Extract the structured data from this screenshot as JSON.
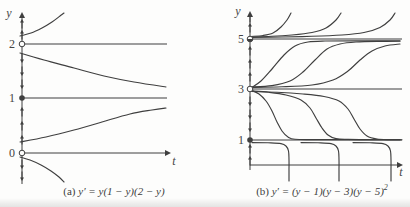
{
  "figure": {
    "kind": "phase portraits with solution curves for autonomous ODEs",
    "ink": "#3f3f3f",
    "background": "#fdfdfc"
  },
  "captions": {
    "a": {
      "prefix": "(a) ",
      "math": "y′ = y(1 − y)(2 − y)",
      "sup": ""
    },
    "b": {
      "prefix": "(b) ",
      "math": "y′ = (y − 1)(y − 3)(y − 5)",
      "sup": "2"
    }
  },
  "chart_data": [
    {
      "type": "line",
      "panel": "a",
      "title": "(a) y′ = y(1 − y)(2 − y)",
      "xlabel": "t",
      "ylabel": "y",
      "yticks": [
        0,
        1,
        2
      ],
      "grid": false,
      "legend": false,
      "equilibria": [
        {
          "y": 2,
          "marker": "open",
          "stability": "repeller"
        },
        {
          "y": 1,
          "marker": "filled",
          "stability": "attractor"
        },
        {
          "y": 0,
          "marker": "open",
          "stability": "repeller"
        }
      ],
      "flow_arrows": [
        {
          "region": "y > 2",
          "direction": "up",
          "count": 2
        },
        {
          "region": "1 < y < 2",
          "direction": "down",
          "count": 3
        },
        {
          "region": "0 < y < 1",
          "direction": "up",
          "count": 3
        },
        {
          "region": "y < 0",
          "direction": "down",
          "count": 2
        }
      ],
      "solution_curves": [
        {
          "region": "y > 2",
          "behavior": "increases steeply away from y = 2"
        },
        {
          "region": "1 < y < 2",
          "behavior": "decreases from near y = 2 toward y = 1"
        },
        {
          "region": "0 < y < 1",
          "behavior": "increases from near y = 0 toward y = 1"
        },
        {
          "region": "y < 0",
          "behavior": "decreases away from y = 0"
        }
      ]
    },
    {
      "type": "line",
      "panel": "b",
      "title": "(b) y′ = (y − 1)(y − 3)(y − 5)²",
      "xlabel": "t",
      "ylabel": "y",
      "yticks": [
        1,
        3,
        5
      ],
      "grid": false,
      "legend": false,
      "equilibria": [
        {
          "y": 5,
          "marker": "half-filled",
          "stability": "semi-stable"
        },
        {
          "y": 3,
          "marker": "open",
          "stability": "repeller"
        },
        {
          "y": 1,
          "marker": "filled",
          "stability": "attractor"
        }
      ],
      "flow_arrows": [
        {
          "region": "y > 5",
          "direction": "up",
          "count": 2
        },
        {
          "region": "3 < y < 5",
          "direction": "up",
          "count": 3
        },
        {
          "region": "1 < y < 3",
          "direction": "down",
          "count": 3
        },
        {
          "region": "y < 1",
          "direction": "up",
          "count": 2
        }
      ],
      "solution_curves": [
        {
          "region": "y > 5",
          "behavior": "three curves hug y = 5 then blow up steeply",
          "count": 3
        },
        {
          "region": "3 < y < 5",
          "behavior": "three sigmoid curves rise from y = 3 to y = 5",
          "count": 3
        },
        {
          "region": "1 < y < 3",
          "behavior": "three curves fall from y = 3 and level off at y = 1",
          "count": 3
        },
        {
          "region": "y < 1",
          "behavior": "three steep curves join y = 1 with vertical branches below it",
          "count": 3
        }
      ]
    }
  ],
  "render": {
    "ink": "#3f3f3f",
    "panels": [
      {
        "name": "a",
        "yAxis": {
          "x": 22,
          "y1": 12,
          "y2": 184
        },
        "tAxis": {
          "y": 153,
          "x1": 22,
          "x2": 171
        },
        "yLabel": {
          "text": "y",
          "x": 9,
          "y": 17
        },
        "tLabel": {
          "text": "t",
          "x": 174,
          "y": 165
        },
        "ticks": [
          {
            "text": "2",
            "x": 15,
            "y": 48
          },
          {
            "text": "1",
            "x": 15,
            "y": 102
          },
          {
            "text": "0",
            "x": 15,
            "y": 157
          }
        ],
        "eqLines": [
          {
            "y": 44,
            "x1": 22,
            "x2": 167
          },
          {
            "y": 98,
            "x1": 22,
            "x2": 167
          }
        ],
        "markers": [
          {
            "x": 22,
            "y": 44,
            "kind": "open"
          },
          {
            "x": 22,
            "y": 98,
            "kind": "filled"
          },
          {
            "x": 22,
            "y": 153,
            "kind": "open"
          }
        ],
        "flowArrows": [
          {
            "x": 22,
            "y": 24,
            "dir": "up"
          },
          {
            "x": 22,
            "y": 35,
            "dir": "up"
          },
          {
            "x": 22,
            "y": 58,
            "dir": "down"
          },
          {
            "x": 22,
            "y": 71,
            "dir": "down"
          },
          {
            "x": 22,
            "y": 84,
            "dir": "down"
          },
          {
            "x": 22,
            "y": 112,
            "dir": "up"
          },
          {
            "x": 22,
            "y": 126,
            "dir": "up"
          },
          {
            "x": 22,
            "y": 140,
            "dir": "up"
          },
          {
            "x": 22,
            "y": 164,
            "dir": "down"
          },
          {
            "x": 22,
            "y": 176,
            "dir": "down"
          }
        ],
        "curves": [
          [
            [
              20,
              36
            ],
            [
              31,
              33
            ],
            [
              42,
              28
            ],
            [
              52,
              22
            ],
            [
              60,
              16
            ],
            [
              64,
              13
            ]
          ],
          [
            [
              20,
              53
            ],
            [
              44,
              60
            ],
            [
              74,
              68
            ],
            [
              104,
              76
            ],
            [
              134,
              82
            ],
            [
              166,
              87
            ]
          ],
          [
            [
              20,
              142
            ],
            [
              46,
              137
            ],
            [
              74,
              130
            ],
            [
              102,
              122
            ],
            [
              130,
              114
            ],
            [
              152,
              110
            ],
            [
              166,
              108
            ]
          ],
          [
            [
              20,
              157
            ],
            [
              30,
              160
            ],
            [
              41,
              165
            ],
            [
              51,
              171
            ],
            [
              59,
              177
            ],
            [
              64,
              182
            ]
          ]
        ]
      },
      {
        "name": "b",
        "yAxis": {
          "x": 250,
          "y1": 11,
          "y2": 170
        },
        "tAxis": {
          "y": 165,
          "x1": 250,
          "x2": 403
        },
        "yLabel": {
          "text": "y",
          "x": 238,
          "y": 15
        },
        "tLabel": {
          "text": "t",
          "x": 401,
          "y": 176
        },
        "ticks": [
          {
            "text": "5",
            "x": 244,
            "y": 43
          },
          {
            "text": "3",
            "x": 244,
            "y": 93
          },
          {
            "text": "1",
            "x": 244,
            "y": 144
          }
        ],
        "eqLines": [
          {
            "y": 39,
            "x1": 250,
            "x2": 402
          },
          {
            "y": 89,
            "x1": 250,
            "x2": 402
          },
          {
            "y": 140,
            "x1": 250,
            "x2": 402
          }
        ],
        "markers": [
          {
            "x": 250,
            "y": 39,
            "kind": "half"
          },
          {
            "x": 250,
            "y": 89,
            "kind": "open"
          },
          {
            "x": 250,
            "y": 140,
            "kind": "filled"
          }
        ],
        "flowArrows": [
          {
            "x": 250,
            "y": 18,
            "dir": "up"
          },
          {
            "x": 250,
            "y": 28,
            "dir": "up"
          },
          {
            "x": 250,
            "y": 51,
            "dir": "up"
          },
          {
            "x": 250,
            "y": 64,
            "dir": "up"
          },
          {
            "x": 250,
            "y": 77,
            "dir": "up"
          },
          {
            "x": 250,
            "y": 101,
            "dir": "down"
          },
          {
            "x": 250,
            "y": 114,
            "dir": "down"
          },
          {
            "x": 250,
            "y": 127,
            "dir": "down"
          },
          {
            "x": 250,
            "y": 149,
            "dir": "up"
          },
          {
            "x": 250,
            "y": 161,
            "dir": "up"
          }
        ],
        "curves": [
          [
            [
              251,
              36.5
            ],
            [
              263,
              35.5
            ],
            [
              273,
              33
            ],
            [
              281,
              27
            ],
            [
              287,
              20
            ],
            [
              291,
              13
            ]
          ],
          [
            [
              251,
              37
            ],
            [
              272,
              36.3
            ],
            [
              292,
              35
            ],
            [
              312,
              32.5
            ],
            [
              326,
              28
            ],
            [
              336,
              20
            ],
            [
              341,
              13
            ]
          ],
          [
            [
              251,
              37.5
            ],
            [
              282,
              37
            ],
            [
              312,
              36.3
            ],
            [
              342,
              35
            ],
            [
              364,
              32.5
            ],
            [
              380,
              27.5
            ],
            [
              390,
              20
            ],
            [
              395,
              13
            ]
          ],
          [
            [
              251,
              88
            ],
            [
              261,
              81
            ],
            [
              272,
              69
            ],
            [
              284,
              55
            ],
            [
              295,
              46
            ],
            [
              308,
              42
            ],
            [
              325,
              41
            ],
            [
              355,
              40.8
            ],
            [
              400,
              40.7
            ]
          ],
          [
            [
              251,
              87
            ],
            [
              272,
              85.6
            ],
            [
              290,
              81
            ],
            [
              303,
              72
            ],
            [
              315,
              60
            ],
            [
              327,
              49
            ],
            [
              340,
              44
            ],
            [
              356,
              42
            ],
            [
              378,
              41.4
            ],
            [
              400,
              41.2
            ]
          ],
          [
            [
              251,
              87.5
            ],
            [
              282,
              86.8
            ],
            [
              312,
              85
            ],
            [
              333,
              80
            ],
            [
              348,
              71
            ],
            [
              360,
              60
            ],
            [
              372,
              51
            ],
            [
              385,
              46
            ],
            [
              400,
              44
            ]
          ],
          [
            [
              251,
              90
            ],
            [
              259,
              94
            ],
            [
              266,
              101
            ],
            [
              272,
              111
            ],
            [
              277,
              122
            ],
            [
              282,
              131
            ],
            [
              288,
              137
            ],
            [
              295,
              139.3
            ],
            [
              315,
              139.6
            ],
            [
              360,
              139.7
            ],
            [
              400,
              139.7
            ]
          ],
          [
            [
              251,
              91
            ],
            [
              269,
              92.3
            ],
            [
              286,
              95
            ],
            [
              301,
              100
            ],
            [
              310,
              108
            ],
            [
              316,
              118
            ],
            [
              322,
              128
            ],
            [
              328,
              135
            ],
            [
              336,
              138.6
            ],
            [
              348,
              139.4
            ],
            [
              375,
              139.7
            ],
            [
              400,
              139.7
            ]
          ],
          [
            [
              251,
              91.5
            ],
            [
              277,
              92.3
            ],
            [
              303,
              94
            ],
            [
              324,
              96.5
            ],
            [
              339,
              101
            ],
            [
              348,
              109
            ],
            [
              354,
              119
            ],
            [
              360,
              129
            ],
            [
              367,
              136
            ],
            [
              377,
              139
            ],
            [
              390,
              139.6
            ],
            [
              402,
              139.7
            ]
          ],
          [
            [
              252,
              142.6
            ],
            [
              268,
              142.8
            ],
            [
              281,
              143.6
            ],
            [
              286,
              146
            ],
            [
              288.5,
              151
            ],
            [
              289,
              160
            ],
            [
              289,
              170
            ],
            [
              289,
              181
            ]
          ],
          [
            [
              301,
              142.6
            ],
            [
              318,
              142.8
            ],
            [
              331,
              143.6
            ],
            [
              336,
              146
            ],
            [
              338.5,
              151
            ],
            [
              339,
              160
            ],
            [
              339,
              170
            ],
            [
              339,
              181
            ]
          ],
          [
            [
              353,
              142.6
            ],
            [
              370,
              142.8
            ],
            [
              383,
              143.6
            ],
            [
              388,
              146
            ],
            [
              390.5,
              151
            ],
            [
              391,
              160
            ],
            [
              391,
              170
            ],
            [
              391,
              181
            ]
          ]
        ]
      }
    ]
  }
}
